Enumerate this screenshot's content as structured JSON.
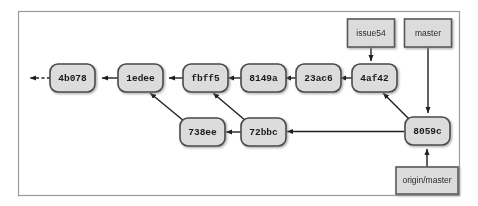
{
  "diagram": {
    "frame": {
      "x": 18,
      "y": 11,
      "width": 442,
      "height": 185
    },
    "colors": {
      "node_fill": "#dcdcdc",
      "node_stroke": "#4a4a4a",
      "ref_fill": "#dcdcdc",
      "ref_stroke": "#5a5a5a",
      "edge": "#1f1f1f",
      "frame_border": "#9a9a9a",
      "background": "#ffffff"
    },
    "commits": [
      {
        "id": "4b078",
        "label": "4b078",
        "cx": 72,
        "cy": 78
      },
      {
        "id": "1edee",
        "label": "1edee",
        "cx": 140,
        "cy": 78
      },
      {
        "id": "fbff5",
        "label": "fbff5",
        "cx": 205,
        "cy": 78
      },
      {
        "id": "8149a",
        "label": "8149a",
        "cx": 263,
        "cy": 78
      },
      {
        "id": "23ac6",
        "label": "23ac6",
        "cx": 318,
        "cy": 78
      },
      {
        "id": "4af42",
        "label": "4af42",
        "cx": 374,
        "cy": 78
      },
      {
        "id": "738ee",
        "label": "738ee",
        "cx": 202,
        "cy": 132
      },
      {
        "id": "72bbc",
        "label": "72bbc",
        "cx": 263,
        "cy": 132
      },
      {
        "id": "8059c",
        "label": "8059c",
        "cx": 427,
        "cy": 131
      }
    ],
    "refs": [
      {
        "id": "issue54",
        "label": "issue54",
        "cx": 371,
        "cy": 33,
        "width": 47,
        "height": 28
      },
      {
        "id": "master",
        "label": "master",
        "cx": 428,
        "cy": 33,
        "width": 47,
        "height": 28
      },
      {
        "id": "origin-master",
        "label": "origin/master",
        "cx": 427,
        "cy": 180,
        "width": 62,
        "height": 27
      }
    ],
    "edges": [
      {
        "from": "1edee",
        "to": "4b078",
        "kind": "straight"
      },
      {
        "from": "fbff5",
        "to": "1edee",
        "kind": "straight"
      },
      {
        "from": "8149a",
        "to": "fbff5",
        "kind": "straight"
      },
      {
        "from": "23ac6",
        "to": "8149a",
        "kind": "straight"
      },
      {
        "from": "4af42",
        "to": "23ac6",
        "kind": "straight"
      },
      {
        "from": "738ee",
        "to": "1edee",
        "kind": "diagonal"
      },
      {
        "from": "72bbc",
        "to": "738ee",
        "kind": "straight"
      },
      {
        "from": "72bbc",
        "to": "fbff5",
        "kind": "diagonal"
      },
      {
        "from": "8059c",
        "to": "72bbc",
        "kind": "straight"
      },
      {
        "from": "8059c",
        "to": "4af42",
        "kind": "diagonal"
      },
      {
        "from": "4b078",
        "to": "parent-ellipsis",
        "kind": "dashed"
      },
      {
        "from": "issue54",
        "to": "4af42",
        "kind": "ref-pointer"
      },
      {
        "from": "master",
        "to": "8059c",
        "kind": "ref-pointer"
      },
      {
        "from": "origin-master",
        "to": "8059c",
        "kind": "ref-pointer"
      }
    ]
  }
}
